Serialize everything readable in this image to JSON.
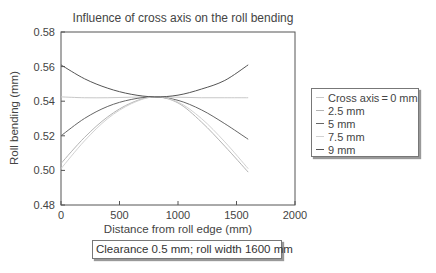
{
  "chart_data": {
    "type": "line",
    "title": "Influence of cross axis on the roll bending",
    "xlabel": "Distance from roll edge (mm)",
    "ylabel": "Roll bending (mm)",
    "xlim": [
      0,
      2000
    ],
    "ylim": [
      0.48,
      0.58
    ],
    "xticks": [
      0,
      500,
      1000,
      1500,
      2000
    ],
    "yticks": [
      0.48,
      0.5,
      0.52,
      0.54,
      0.56,
      0.58
    ],
    "xtick_labels": [
      "0",
      "500",
      "1000",
      "1500",
      "2000"
    ],
    "ytick_labels": [
      "0.48",
      "0.50",
      "0.52",
      "0.54",
      "0.56",
      "0.58"
    ],
    "grid": false,
    "legend_position": "right-outside",
    "x": [
      0,
      200,
      400,
      600,
      800,
      1000,
      1200,
      1400,
      1600
    ],
    "series": [
      {
        "name": "Cross axis = 0 mm",
        "color": "#c8c8c8",
        "values": [
          0.5425,
          0.542,
          0.542,
          0.5423,
          0.5425,
          0.5423,
          0.542,
          0.542,
          0.542
        ]
      },
      {
        "name": "2.5 mm",
        "color": "#b4b4b4",
        "values": [
          0.504,
          0.519,
          0.531,
          0.539,
          0.5425,
          0.539,
          0.528,
          0.514,
          0.499
        ]
      },
      {
        "name": "5 mm",
        "color": "#666666",
        "values": [
          0.52,
          0.53,
          0.537,
          0.541,
          0.5425,
          0.5405,
          0.535,
          0.527,
          0.518
        ]
      },
      {
        "name": "7.5 mm",
        "color": "#d2d2d2",
        "values": [
          0.501,
          0.517,
          0.53,
          0.5385,
          0.5425,
          0.5395,
          0.53,
          0.5165,
          0.501
        ]
      },
      {
        "name": "9 mm",
        "color": "#555555",
        "values": [
          0.561,
          0.553,
          0.5475,
          0.544,
          0.5425,
          0.5435,
          0.547,
          0.552,
          0.561
        ]
      }
    ],
    "annotation": "Clearance 0.5 mm; roll width 1600 mm"
  },
  "legend": {
    "items": [
      {
        "label": "Cross axis = 0 mm",
        "color": "#c8c8c8"
      },
      {
        "label": "2.5 mm",
        "color": "#b4b4b4"
      },
      {
        "label": "5 mm",
        "color": "#666666"
      },
      {
        "label": "7.5 mm",
        "color": "#d2d2d2"
      },
      {
        "label": "9 mm",
        "color": "#555555"
      }
    ]
  },
  "caption": "Clearance 0.5 mm; roll width 1600 mm"
}
